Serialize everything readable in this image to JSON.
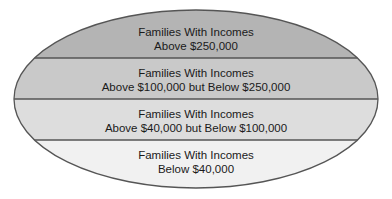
{
  "diagram": {
    "type": "stacked-ellipse",
    "bands": [
      {
        "line1": "Families With Incomes",
        "line2": "Above $250,000",
        "fill": "#b4b4b4"
      },
      {
        "line1": "Families With Incomes",
        "line2": "Above $100,000 but Below $250,000",
        "fill": "#c9c9c9"
      },
      {
        "line1": "Families With Incomes",
        "line2": "Above $40,000 but Below $100,000",
        "fill": "#dddddd"
      },
      {
        "line1": "Families With Incomes",
        "line2": "Below $40,000",
        "fill": "#f1f1f1"
      }
    ],
    "outline_color": "#555555"
  }
}
